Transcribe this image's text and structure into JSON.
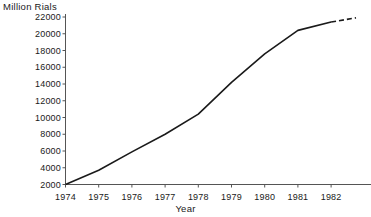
{
  "chart_data": {
    "type": "line",
    "title": "",
    "ylabel": "Million Rials",
    "xlabel": "Year",
    "categories": [
      "1974",
      "1975",
      "1976",
      "1977",
      "1978",
      "1979",
      "1980",
      "1981",
      "1982"
    ],
    "x": [
      1974,
      1975,
      1976,
      1977,
      1978,
      1979,
      1980,
      1981,
      1982
    ],
    "values": [
      2000,
      3700,
      5900,
      8000,
      10400,
      14200,
      17600,
      20400,
      21400
    ],
    "xlim": [
      1974,
      1982.8
    ],
    "ylim": [
      2000,
      22000
    ],
    "yticks": [
      2000,
      4000,
      6000,
      8000,
      10000,
      12000,
      14000,
      16000,
      18000,
      20000,
      22000
    ],
    "ytick_labels": [
      "2000",
      "4000",
      "6000",
      "8000",
      "10000",
      "12000",
      "14000",
      "16000",
      "18000",
      "20000",
      "22000"
    ],
    "xticks": [
      1974,
      1975,
      1976,
      1977,
      1978,
      1979,
      1980,
      1981,
      1982
    ],
    "grid": false,
    "legend": false,
    "series": [
      {
        "name": "Million Rials",
        "style": "solid",
        "color": "#1a1a1a",
        "points": [
          {
            "x": 1974,
            "y": 2000
          },
          {
            "x": 1975,
            "y": 3700
          },
          {
            "x": 1976,
            "y": 5900
          },
          {
            "x": 1977,
            "y": 8000
          },
          {
            "x": 1978,
            "y": 10400
          },
          {
            "x": 1979,
            "y": 14200
          },
          {
            "x": 1980,
            "y": 17600
          },
          {
            "x": 1981,
            "y": 20400
          },
          {
            "x": 1982,
            "y": 21400
          }
        ]
      },
      {
        "name": "projection",
        "style": "dashed",
        "color": "#1a1a1a",
        "points": [
          {
            "x": 1982,
            "y": 21400
          },
          {
            "x": 1982.75,
            "y": 21900
          }
        ]
      }
    ],
    "annotations": []
  },
  "axes": {
    "y_axis_line_color": "#555555",
    "x_axis_line_color": "#555555",
    "background": "#ffffff"
  }
}
